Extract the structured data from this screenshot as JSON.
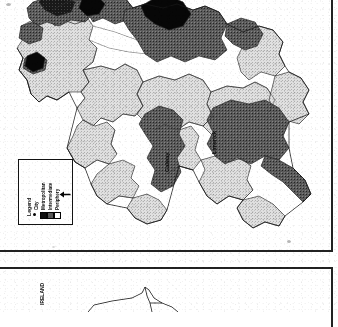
{
  "document": {
    "type": "scanned-journal-page",
    "description": "Photocopied page containing a choropleth map of Ireland classified by settlement type, plus the top edge of a following figure panel.",
    "background_color": "#fdfdfd",
    "ink_color": "#1f1f1f"
  },
  "panels": {
    "top": {
      "name": "choropleth-map-panel",
      "border_color": "#2c2c2c"
    },
    "bottom": {
      "name": "second-figure-panel",
      "border_color": "#2c2c2c"
    }
  },
  "map": {
    "title": "",
    "region": "Ireland",
    "classes": [
      {
        "key": "city",
        "label": "City",
        "fill": "#111111",
        "swatch": "dot"
      },
      {
        "key": "metropolitan",
        "label": "Metropolitan",
        "fill": "#1a1a1a",
        "swatch": "filled-square"
      },
      {
        "key": "intermediate",
        "label": "Intermediate",
        "fill": "#5c5c5c",
        "swatch": "gray-square"
      },
      {
        "key": "periphery",
        "label": "Periphery",
        "fill": "#d0d0d0",
        "swatch": "open-square"
      }
    ],
    "boundary_color": "#2a2a2a",
    "place_labels": [
      {
        "name": "dublin",
        "text": "Dublin",
        "rotation": -90
      },
      {
        "name": "galway",
        "text": "Galway",
        "rotation": -90
      },
      {
        "name": "limerick",
        "text": "Limerick",
        "rotation": -90
      }
    ]
  },
  "legend": {
    "title": "Legend",
    "rotation": -90,
    "border_color": "#1f1f1f",
    "items": [
      {
        "label": "City"
      },
      {
        "label": "Metropolitan"
      },
      {
        "label": "Intermediate"
      },
      {
        "label": "Periphery"
      }
    ],
    "arrow": {
      "name": "pointer-arrow",
      "direction": "left"
    }
  },
  "figure_two": {
    "label": "IRELAND",
    "rotation": -90,
    "outline_color": "#2b2b2b"
  }
}
